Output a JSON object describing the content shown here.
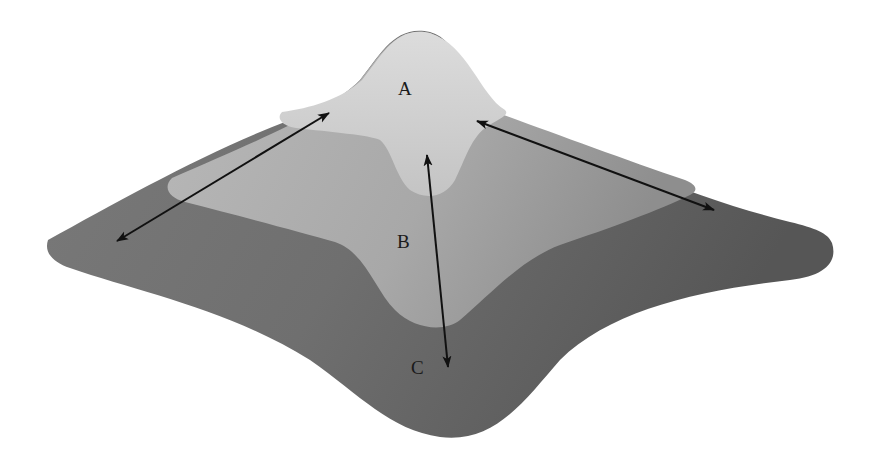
{
  "figure": {
    "type": "surface-landscape-diagram",
    "regions": [
      {
        "id": "A",
        "label": "A",
        "shade": "light",
        "color": "#d2d2d2"
      },
      {
        "id": "B",
        "label": "B",
        "shade": "medium",
        "color": "#b3b3b3"
      },
      {
        "id": "C",
        "label": "C",
        "shade": "dark",
        "color": "#7c7c7c"
      }
    ],
    "arrows": [
      {
        "name": "arrow-left-diagonal",
        "heads": "both"
      },
      {
        "name": "arrow-right-diagonal",
        "heads": "both"
      },
      {
        "name": "arrow-center-vertical",
        "heads": "both"
      }
    ],
    "colors": {
      "background": "#ffffff",
      "arrow": "#111111",
      "text": "#1a1a1a"
    }
  }
}
